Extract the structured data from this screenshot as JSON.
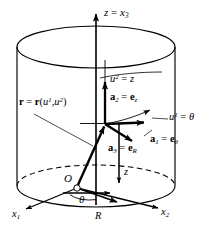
{
  "figure": {
    "type": "geometry-diagram",
    "background_color": "#ffffff",
    "line_color": "#000000",
    "width": 203,
    "height": 231
  },
  "labels": {
    "axis_vertical": {
      "text": "z = x3",
      "main": "z",
      "equals": " = ",
      "var": "x",
      "sub": "3"
    },
    "coord_curve_u2": {
      "var": "u",
      "sup": "2",
      "equals": " = ",
      "value": "z"
    },
    "basis_a2": {
      "vec": "a",
      "sub": "2",
      "equals": " = ",
      "evec": "e",
      "esub": "z"
    },
    "position_vector": {
      "vec": "r",
      "equals": " = ",
      "vec2": "r",
      "open": "(",
      "u1": "u",
      "sup1": "1",
      "comma": ",",
      "u2": "u",
      "sup2": "2",
      "close": ")"
    },
    "coord_curve_u1": {
      "var": "u",
      "sup": "1",
      "equals": " = ",
      "value": "θ"
    },
    "basis_a1": {
      "vec": "a",
      "sub": "1",
      "equals": " = ",
      "evec": "e",
      "esub": "θ"
    },
    "basis_a3": {
      "vec": "a",
      "sub": "3",
      "equals": " = ",
      "evec": "e",
      "esub": "R"
    },
    "origin": {
      "text": "O"
    },
    "height_z": {
      "text": "z"
    },
    "angle_theta": {
      "text": "θ"
    },
    "radius_R": {
      "text": "R"
    },
    "axis_x1": {
      "var": "x",
      "sub": "1"
    },
    "axis_x2": {
      "var": "x",
      "sub": "2"
    }
  },
  "geometry": {
    "cylinder": {
      "center_x": 96,
      "top_ellipse_cy": 47,
      "bottom_ellipse_cy": 186,
      "rx": 79,
      "ry": 21
    },
    "vertical_axis": {
      "x": 96,
      "y_top": 10,
      "y_bottom": 205
    },
    "surface_point": {
      "x": 105,
      "y": 124
    },
    "origin_point": {
      "x": 77,
      "y": 188
    }
  }
}
